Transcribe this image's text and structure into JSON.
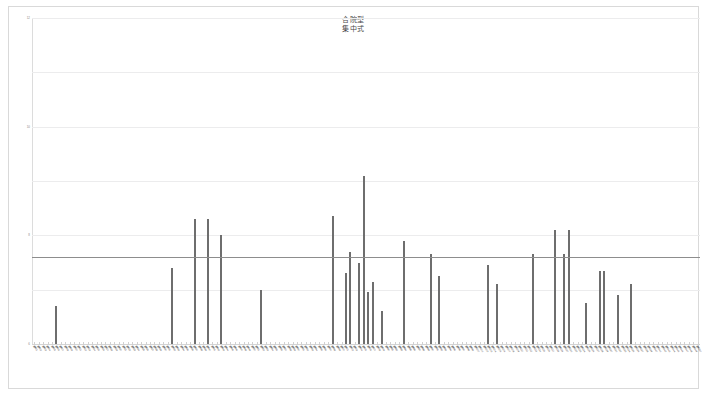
{
  "chart_data": {
    "type": "bar",
    "title": "合院型\n集中式",
    "title_lines": [
      "合院型",
      "集中式"
    ],
    "xlabel": "",
    "ylabel": "",
    "ylim": [
      0,
      12
    ],
    "grid": true,
    "legend_position": "none",
    "bar_color": "#6e6e6e",
    "gridline_color": "#ececed",
    "reference_line": {
      "value": 3.2,
      "label": "3.2",
      "color": "#8d8d8d"
    },
    "yticks": [
      {
        "value": 12,
        "label": "12"
      },
      {
        "value": 10,
        "label": "10"
      },
      {
        "value": 8,
        "label": "8"
      },
      {
        "value": 6,
        "label": "6"
      },
      {
        "value": 4,
        "label": "4"
      },
      {
        "value": 3.2,
        "label": "3.2"
      },
      {
        "value": 2,
        "label": "2"
      },
      {
        "value": 0,
        "label": "0"
      }
    ],
    "categories": [
      "案例01",
      "案例02",
      "案例03",
      "案例04",
      "案例05",
      "案例06",
      "案例07",
      "案例08",
      "案例09",
      "案例10",
      "案例11",
      "案例12",
      "案例13",
      "案例14",
      "案例15",
      "案例16",
      "案例17",
      "案例18",
      "案例19",
      "案例20",
      "案例21",
      "案例22",
      "案例23",
      "案例24",
      "案例25",
      "案例26",
      "案例27",
      "案例28",
      "案例29",
      "案例30",
      "案例31",
      "案例32",
      "案例33",
      "案例34",
      "案例35",
      "案例36",
      "案例37",
      "案例38",
      "案例39",
      "案例40",
      "案例41",
      "案例42",
      "案例43",
      "案例44",
      "案例45",
      "案例46",
      "案例47",
      "案例48",
      "案例49",
      "案例50",
      "案例51",
      "案例52",
      "案例53",
      "案例54",
      "案例55",
      "案例56",
      "案例57",
      "案例58",
      "案例59",
      "案例60",
      "案例61",
      "案例62",
      "案例63",
      "案例64",
      "案例65",
      "案例66",
      "案例67",
      "案例68",
      "案例69",
      "案例70",
      "案例71",
      "案例72",
      "案例73",
      "案例74",
      "案例75",
      "案例76",
      "案例77",
      "案例78",
      "案例79",
      "案例80",
      "案例81",
      "案例82",
      "案例83",
      "案例84",
      "案例85",
      "案例86",
      "案例87",
      "案例88",
      "案例89",
      "案例90",
      "案例91",
      "案例92",
      "案例93",
      "案例94",
      "案例95",
      "案例96",
      "案例97",
      "案例98",
      "案例99",
      "案例100",
      "案例101",
      "案例102",
      "案例103",
      "案例104",
      "案例105",
      "案例106",
      "案例107",
      "案例108",
      "案例109",
      "案例110",
      "案例111",
      "案例112",
      "案例113",
      "案例114",
      "案例115",
      "案例116",
      "案例117",
      "案例118",
      "案例119",
      "案例120",
      "案例121",
      "案例122",
      "案例123",
      "案例124",
      "案例125",
      "案例126",
      "案例127",
      "案例128",
      "案例129",
      "案例130",
      "案例131",
      "案例132",
      "案例133",
      "案例134",
      "案例135",
      "案例136",
      "案例137",
      "案例138",
      "案例139",
      "案例140",
      "案例141",
      "案例142",
      "案例143",
      "案例144",
      "案例145",
      "案例146",
      "案例147",
      "案例148",
      "案例149",
      "案例150"
    ],
    "values": [
      0,
      0,
      0,
      0,
      0,
      1.4,
      0,
      0,
      0,
      0,
      0,
      0,
      0,
      0,
      0,
      0,
      0,
      0,
      0,
      0,
      0,
      0,
      0,
      0,
      0,
      0,
      0,
      0,
      0,
      0,
      0,
      2.8,
      0,
      0,
      0,
      0,
      4.6,
      0,
      0,
      4.6,
      0,
      0,
      4.0,
      0,
      0,
      0,
      0,
      0,
      0,
      0,
      0,
      2.0,
      0,
      0,
      0,
      0,
      0,
      0,
      0,
      0,
      0,
      0,
      0,
      0,
      0,
      0,
      0,
      4.7,
      0,
      0,
      2.6,
      3.4,
      0,
      3.0,
      6.2,
      1.9,
      2.3,
      0,
      1.2,
      0,
      0,
      0,
      0,
      3.8,
      0,
      0,
      0,
      0,
      0,
      3.3,
      0,
      2.5,
      0,
      0,
      0,
      0,
      0,
      0,
      0,
      0,
      0,
      0,
      2.9,
      0,
      2.2,
      0,
      0,
      0,
      0,
      0,
      0,
      0,
      3.3,
      0,
      0,
      0,
      0,
      4.2,
      0,
      3.3,
      4.2,
      0,
      0,
      0,
      1.5,
      0,
      0,
      2.7,
      2.7,
      0,
      0,
      1.8,
      0,
      0,
      2.2,
      0,
      0,
      0,
      0,
      0,
      0,
      0,
      0,
      0,
      0,
      0,
      0,
      0,
      0,
      0
    ]
  }
}
